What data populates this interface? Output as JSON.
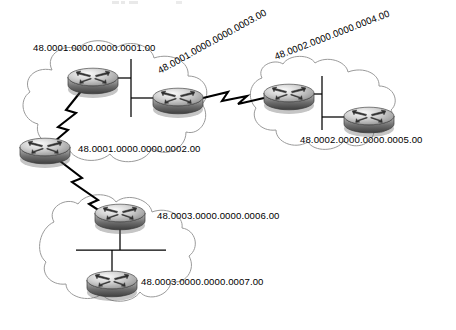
{
  "diagram": {
    "type": "network-topology",
    "title_fragment": "",
    "background": "#ffffff",
    "clouds": [
      {
        "id": "cloud-area-48-0001",
        "name": "area-1-cloud"
      },
      {
        "id": "cloud-area-48-0002",
        "name": "area-2-cloud"
      },
      {
        "id": "cloud-area-48-0003",
        "name": "area-3-cloud"
      }
    ],
    "routers": [
      {
        "id": "router-0001",
        "nsap": "48.0001.0000.0000.0001.00",
        "area": "48.0001",
        "x": 93,
        "y": 78,
        "label_x": 33,
        "label_y": 51,
        "rotation": 0
      },
      {
        "id": "router-0002",
        "nsap": "48.0001.0000.0000.0002.00",
        "area": "48.0001",
        "x": 45,
        "y": 148,
        "label_x": 78,
        "label_y": 152,
        "rotation": 0
      },
      {
        "id": "router-0003",
        "nsap": "48.0001.0000.0000.0003.00",
        "area": "48.0001",
        "x": 178,
        "y": 98,
        "label_x": 160,
        "label_y": 74,
        "rotation": -29
      },
      {
        "id": "router-0004",
        "nsap": "48.0002.0000.0000.0004.00",
        "area": "48.0002",
        "x": 289,
        "y": 94,
        "label_x": 276,
        "label_y": 60,
        "rotation": -21
      },
      {
        "id": "router-0005",
        "nsap": "48.0002.0000.0000.0005.00",
        "area": "48.0002",
        "x": 369,
        "y": 117,
        "label_x": 300,
        "label_y": 143,
        "rotation": 0
      },
      {
        "id": "router-0006",
        "nsap": "48.0003.0000.0000.0006.00",
        "area": "48.0003",
        "x": 120,
        "y": 214,
        "label_x": 157,
        "label_y": 219,
        "rotation": 0
      },
      {
        "id": "router-0007",
        "nsap": "48.0003.0000.0000.0007.00",
        "area": "48.0003",
        "x": 112,
        "y": 281,
        "label_x": 141,
        "label_y": 285,
        "rotation": 0
      }
    ],
    "links": [
      {
        "id": "link-0001-0003",
        "kind": "ethernet-bus",
        "from": "router-0001",
        "to": "router-0003"
      },
      {
        "id": "link-0001-0002",
        "kind": "serial-lightning",
        "from": "router-0001",
        "to": "router-0002"
      },
      {
        "id": "link-0003-0004",
        "kind": "serial-lightning",
        "from": "router-0003",
        "to": "router-0004"
      },
      {
        "id": "link-0004-0005",
        "kind": "ethernet-bus",
        "from": "router-0004",
        "to": "router-0005"
      },
      {
        "id": "link-0002-0006",
        "kind": "serial-lightning",
        "from": "router-0002",
        "to": "router-0006"
      },
      {
        "id": "link-0006-0007",
        "kind": "ethernet-bus",
        "from": "router-0006",
        "to": "router-0007"
      }
    ],
    "colors": {
      "cloud_stroke": "#9a9a9a",
      "line": "#000000",
      "router_top": "#f2f2f2",
      "router_mid": "#8d8d8d",
      "router_dark": "#4a4a4a",
      "text": "#000000"
    }
  }
}
